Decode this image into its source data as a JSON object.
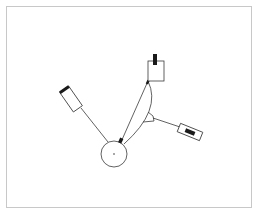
{
  "diagram": {
    "type": "mechanical-schematic",
    "colors": {
      "background": "#ffffff",
      "frame": "#c8c8c8",
      "stroke": "#3a3a3a",
      "fill_dark": "#1a1a1a"
    },
    "elements": {
      "frame": {
        "x": 6,
        "y": 6,
        "w": 246,
        "h": 202
      },
      "hub_circle": {
        "cx": 114,
        "cy": 154,
        "r": 13
      },
      "left_sensor": {
        "cx": 71,
        "cy": 99,
        "w": 24,
        "h": 11,
        "angle": -55
      },
      "top_block": {
        "x": 148,
        "y": 61,
        "w": 16,
        "h": 20
      },
      "right_sensor": {
        "cx": 190,
        "cy": 132,
        "w": 24,
        "h": 9,
        "angle": 22
      }
    },
    "labels": []
  }
}
